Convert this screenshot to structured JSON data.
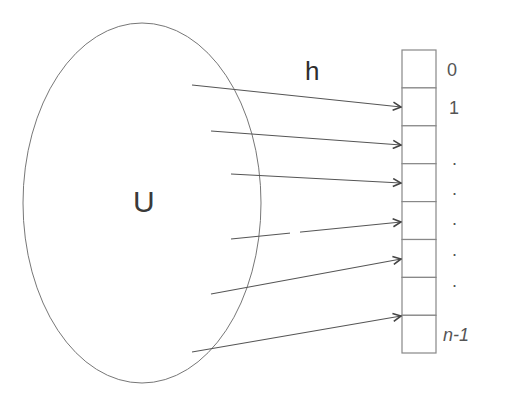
{
  "diagram": {
    "type": "hash-function-mapping",
    "set_label": "U",
    "function_label": "h",
    "table": {
      "cells": 8,
      "index_labels": [
        "0",
        "1",
        ".",
        ".",
        ".",
        ".",
        ".",
        "n-1"
      ]
    },
    "arrows": [
      {
        "from": "U",
        "to_cell": 1
      },
      {
        "from": "U",
        "to_cell": 2
      },
      {
        "from": "U",
        "to_cell": 3
      },
      {
        "from": "U",
        "to_cell": 4
      },
      {
        "from": "U",
        "to_cell": 5
      },
      {
        "from": "U",
        "to_cell": 7
      }
    ],
    "colors": {
      "stroke": "#666666",
      "arrow": "#444444",
      "text": "#444444"
    }
  }
}
